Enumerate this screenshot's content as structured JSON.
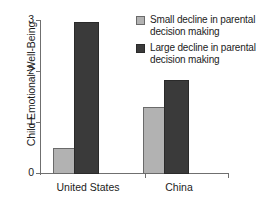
{
  "chart_data": {
    "type": "bar",
    "title": "",
    "subtitle": "",
    "xlabel": "",
    "ylabel": "Child Emotional Well-Being",
    "categories": [
      "United States",
      "China"
    ],
    "series": [
      {
        "name": "Small decline in parental decision making",
        "color": "#b2b2b2",
        "values": [
          0.5,
          1.3
        ]
      },
      {
        "name": "Large decline in parental decision making",
        "color": "#3a3a3a",
        "values": [
          2.95,
          1.82
        ]
      }
    ],
    "ylim": [
      0,
      3
    ],
    "yticks": [
      "0",
      "1",
      "2",
      "3"
    ],
    "ytick_values": [
      0,
      1,
      2,
      3
    ],
    "grid": false,
    "legend_position": "top-right"
  },
  "axes": {
    "y_title": "Child Emotional Well-Being",
    "y_ticks": [
      {
        "label": "3",
        "value": 3
      },
      {
        "label": "2",
        "value": 2
      },
      {
        "label": "1",
        "value": 1
      },
      {
        "label": "0",
        "value": 0
      }
    ],
    "x_categories": [
      {
        "label": "United States"
      },
      {
        "label": "China"
      }
    ]
  },
  "legend": {
    "items": [
      {
        "label": "Small decline in parental decision making",
        "swatch": "light"
      },
      {
        "label": "Large decline in parental decision making",
        "swatch": "dark"
      }
    ]
  },
  "bars": [
    {
      "group": "United States",
      "series": "Small decline in parental decision making",
      "value": 0.5
    },
    {
      "group": "United States",
      "series": "Large decline in parental decision making",
      "value": 2.95
    },
    {
      "group": "China",
      "series": "Small decline in parental decision making",
      "value": 1.3
    },
    {
      "group": "China",
      "series": "Large decline in parental decision making",
      "value": 1.82
    }
  ],
  "colors": {
    "light_bar": "#b2b2b2",
    "dark_bar": "#3a3a3a",
    "axis": "#6f6f6f",
    "text": "#1c1c1c",
    "background": "#ffffff"
  }
}
